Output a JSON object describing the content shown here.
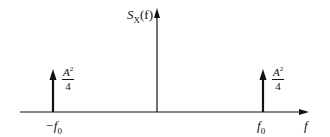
{
  "diagram": {
    "type": "power spectral density impulse plot",
    "y_axis_label": "S",
    "y_axis_label_sub": "X",
    "y_axis_label_arg": "(f)",
    "x_axis_label": "f",
    "impulses": [
      {
        "position_label": "−f",
        "position_sub": "0",
        "height_num": "A",
        "height_num_exp": "2",
        "height_den": "4"
      },
      {
        "position_label": "f",
        "position_sub": "0",
        "height_num": "A",
        "height_num_exp": "2",
        "height_den": "4"
      }
    ],
    "colors": {
      "line": "#111111",
      "background": "#ffffff"
    }
  }
}
